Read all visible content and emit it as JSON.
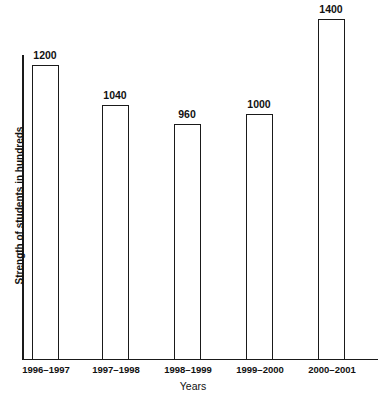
{
  "chart_data": {
    "type": "bar",
    "title": "",
    "subtitle": "",
    "xlabel": "Years",
    "ylabel": "Strength of students in hundreds",
    "categories": [
      "1996–1997",
      "1997–1998",
      "1998–1999",
      "1999–2000",
      "2000–2001"
    ],
    "values": [
      1200,
      1040,
      960,
      1000,
      1400
    ],
    "value_labels": [
      "1200",
      "1040",
      "960",
      "1000",
      "1400"
    ],
    "ylim": [
      0,
      1475
    ],
    "grid": false,
    "legend": null,
    "bar_style": {
      "fill": "#ffffff",
      "stroke": "#1a1a1a",
      "stroke_width": 1.5
    },
    "axis_color": "#1a1a1a",
    "background": "#ffffff"
  },
  "bars": [
    {
      "category": "1996–1997",
      "value": 1200,
      "label": "1200",
      "left": 32,
      "width": 27,
      "height_px": 294,
      "label_left": 15
    },
    {
      "category": "1997–1998",
      "value": 1040,
      "label": "1040",
      "left": 102,
      "width": 27,
      "height_px": 254,
      "label_left": 85
    },
    {
      "category": "1998–1999",
      "value": 960,
      "label": "960",
      "left": 174,
      "width": 27,
      "height_px": 235,
      "label_left": 157
    },
    {
      "category": "1999–2000",
      "value": 1000,
      "label": "1000",
      "left": 246,
      "width": 27,
      "height_px": 245,
      "label_left": 229
    },
    {
      "category": "2000–2001",
      "value": 1400,
      "label": "1400",
      "left": 318,
      "width": 27,
      "height_px": 340,
      "label_left": 301
    }
  ],
  "category_labels": [
    {
      "text": "1996–1997",
      "left": 6
    },
    {
      "text": "1997–1998",
      "left": 76
    },
    {
      "text": "1998–1999",
      "left": 148
    },
    {
      "text": "1999–2000",
      "left": 220
    },
    {
      "text": "2000–2001",
      "left": 292
    }
  ],
  "axes": {
    "x_title": "Years",
    "y_title": "Strength of students in hundreds"
  }
}
